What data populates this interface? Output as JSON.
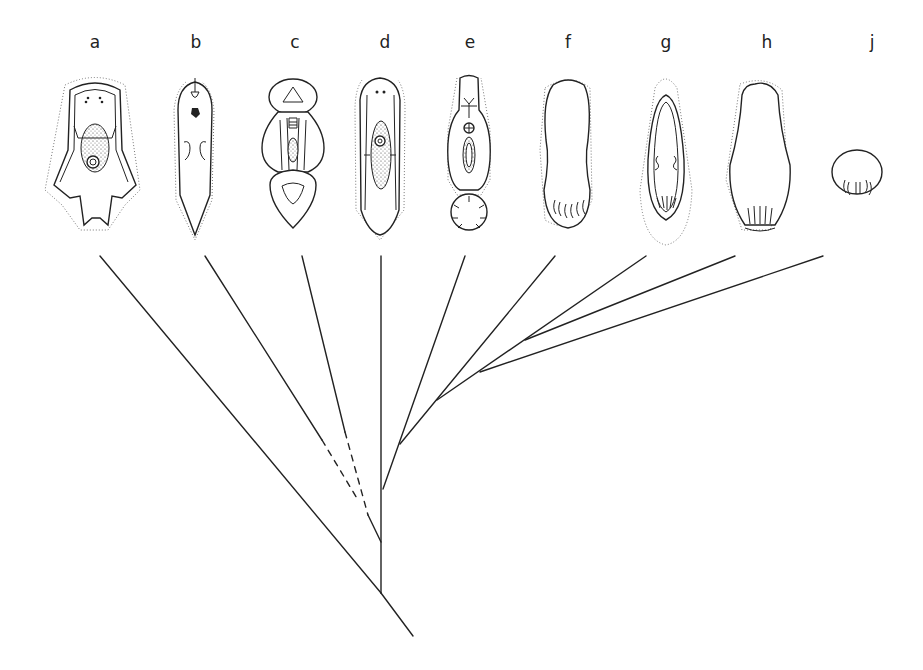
{
  "figure": {
    "type": "phylogenetic-tree",
    "taxa": [
      {
        "label": "a",
        "x": 95,
        "branch_top": [
          100,
          256
        ]
      },
      {
        "label": "b",
        "x": 190,
        "branch_top": [
          205,
          256
        ]
      },
      {
        "label": "c",
        "x": 295,
        "branch_top": [
          302,
          256
        ]
      },
      {
        "label": "d",
        "x": 383,
        "branch_top": [
          380,
          256
        ]
      },
      {
        "label": "e",
        "x": 469,
        "branch_top": [
          465,
          256
        ]
      },
      {
        "label": "f",
        "x": 568,
        "branch_top": [
          555,
          256
        ]
      },
      {
        "label": "g",
        "x": 666,
        "branch_top": [
          646,
          256
        ]
      },
      {
        "label": "h",
        "x": 767,
        "branch_top": [
          735,
          256
        ]
      },
      {
        "label": "j",
        "x": 872,
        "branch_top": [
          823,
          256
        ]
      }
    ],
    "nodes": {
      "root": [
        413,
        636
      ],
      "n1": [
        381,
        593
      ],
      "n2": [
        381,
        542
      ],
      "n3": [
        383,
        489
      ],
      "n4": [
        400,
        444
      ],
      "n5": [
        437,
        400
      ],
      "n6": [
        480,
        372
      ],
      "n7": [
        525,
        340
      ]
    },
    "dashed_segments": [
      {
        "from_taxon": "b",
        "note": "uncertain connection"
      },
      {
        "from_taxon": "c",
        "note": "uncertain connection"
      }
    ]
  }
}
